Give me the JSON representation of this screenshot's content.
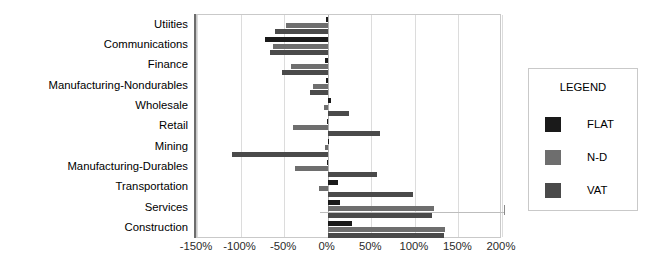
{
  "chart_data": {
    "type": "bar",
    "orientation": "horizontal",
    "title": "",
    "xlabel": "",
    "ylabel": "",
    "xlim": [
      -150,
      200
    ],
    "xticks": [
      -150,
      -100,
      -50,
      0,
      50,
      100,
      150,
      200
    ],
    "xtick_labels": [
      "-150%",
      "-100%",
      "-50%",
      "0%",
      "50%",
      "100%",
      "150%",
      "200%"
    ],
    "grid": true,
    "legend_position": "right-outside",
    "legend_title": "LEGEND",
    "categories": [
      "Utiities",
      "Communications",
      "Finance",
      "Manufacturing-Nondurables",
      "Wholesale",
      "Retail",
      "Mining",
      "Manufacturing-Durables",
      "Transportation",
      "Services",
      "Construction"
    ],
    "series": [
      {
        "name": "FLAT",
        "color": "#1a1a1a",
        "values": [
          -2,
          -72,
          -3,
          -2,
          4,
          -1,
          2,
          -1,
          12,
          14,
          28
        ]
      },
      {
        "name": "N-D",
        "color": "#6e6e6e",
        "values": [
          -48,
          -63,
          -42,
          -17,
          -4,
          -40,
          -3,
          -37,
          -10,
          122,
          135
        ]
      },
      {
        "name": "VAT",
        "color": "#4a4a4a",
        "values": [
          -60,
          -66,
          -53,
          -20,
          24,
          60,
          -110,
          57,
          98,
          120,
          133
        ]
      }
    ]
  },
  "legend": {
    "title": "LEGEND",
    "items": [
      {
        "label": "FLAT",
        "swatch": "flat"
      },
      {
        "label": "N-D",
        "swatch": "nd"
      },
      {
        "label": "VAT",
        "swatch": "vat"
      }
    ]
  },
  "colors": {
    "flat": "#1a1a1a",
    "nd": "#6e6e6e",
    "vat": "#4a4a4a",
    "grid": "#dcdcdc",
    "frame": "#c9c9c9",
    "axis": "#6d6d6d"
  }
}
